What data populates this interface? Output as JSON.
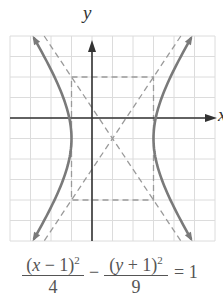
{
  "figure": {
    "type": "hyperbola-graph",
    "axis_labels": {
      "x": "x",
      "y": "y"
    },
    "grid": {
      "x_min": -4,
      "x_max": 6,
      "y_min": -6,
      "y_max": 4,
      "step": 1
    },
    "colors": {
      "grid": "#dcdcdc",
      "axes": "#333333",
      "curve": "#7a7a7a",
      "dashed": "#9a9a9a",
      "text": "#555555"
    },
    "hyperbola": {
      "h": 1,
      "k": -1,
      "a": 2,
      "b": 3,
      "orientation": "horizontal"
    },
    "asymptotes": [
      {
        "slope": 1.5,
        "through": [
          1,
          -1
        ]
      },
      {
        "slope": -1.5,
        "through": [
          1,
          -1
        ]
      }
    ],
    "fundamental_rectangle": {
      "x": [
        -1,
        3
      ],
      "y": [
        -4,
        2
      ]
    }
  },
  "equation": {
    "term1_num_open": "(",
    "term1_var": "x",
    "term1_num_rest": " − 1)",
    "term1_exp": "2",
    "term1_den": "4",
    "minus": "−",
    "term2_num_open": "(",
    "term2_var": "y",
    "term2_num_rest": " + 1)",
    "term2_exp": "2",
    "term2_den": "9",
    "rhs": "= 1"
  }
}
